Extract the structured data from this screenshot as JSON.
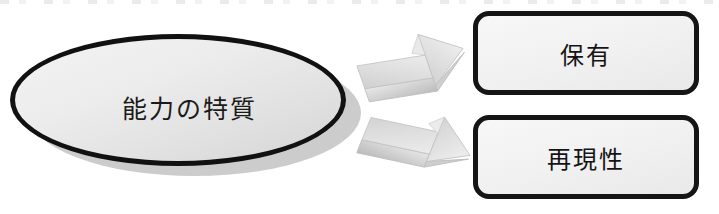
{
  "diagram": {
    "type": "flow-diagram",
    "background_color": "#ffffff",
    "source_node": {
      "shape": "ellipse",
      "label": "能力の特質",
      "fill_color": "#ececec",
      "border_color": "#111111",
      "shadow_color": "#b8b8b8"
    },
    "connectors": [
      {
        "name": "arrow-upper",
        "style": "3d-block-arrow",
        "direction": "up-right",
        "fill_color": "#d9d9d9",
        "from": "能力の特質",
        "to": "保有"
      },
      {
        "name": "arrow-lower",
        "style": "3d-block-arrow",
        "direction": "down-right",
        "fill_color": "#d9d9d9",
        "from": "能力の特質",
        "to": "再現性"
      }
    ],
    "target_nodes": [
      {
        "shape": "rounded-rectangle",
        "label": "保有",
        "fill_color": "#f1f1f1",
        "border_color": "#151515"
      },
      {
        "shape": "rounded-rectangle",
        "label": "再現性",
        "fill_color": "#f1f1f1",
        "border_color": "#151515"
      }
    ]
  }
}
